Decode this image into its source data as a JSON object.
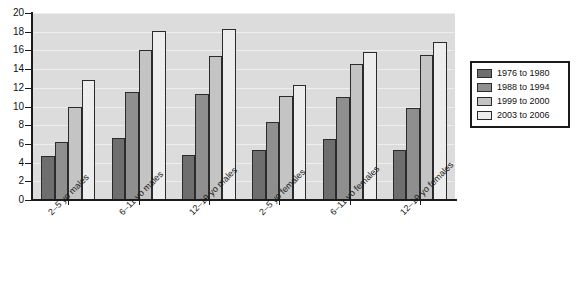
{
  "chart_data": {
    "type": "bar",
    "title": "",
    "xlabel": "",
    "ylabel": "",
    "ylim": [
      0,
      20
    ],
    "ytick_step": 2,
    "grid": true,
    "legend_position": "right",
    "categories": [
      "2–5 yo males",
      "6–11 yo males",
      "12–19 yo males",
      "2–5 yo females",
      "6–11 yo females",
      "12–19 yo females"
    ],
    "ytick_labels": [
      "0",
      "2",
      "4",
      "6",
      "8",
      "10",
      "12",
      "14",
      "16",
      "18",
      "20"
    ],
    "series": [
      {
        "name": "1976 to 1980",
        "color": "#6e6e6e",
        "values": [
          4.7,
          6.6,
          4.8,
          5.4,
          6.5,
          5.4
        ]
      },
      {
        "name": "1988 to 1994",
        "color": "#8f8f8f",
        "values": [
          6.2,
          11.6,
          11.3,
          8.3,
          11.0,
          9.8
        ]
      },
      {
        "name": "1999 to 2000",
        "color": "#c4c4c4",
        "values": [
          9.9,
          16.0,
          15.4,
          11.1,
          14.5,
          15.5
        ]
      },
      {
        "name": "2003 to 2006",
        "color": "#ededed",
        "values": [
          12.8,
          18.1,
          18.3,
          12.3,
          15.8,
          16.9
        ]
      }
    ]
  },
  "legend": {
    "items": [
      {
        "label": "1976 to 1980",
        "color": "#6e6e6e"
      },
      {
        "label": "1988 to 1994",
        "color": "#8f8f8f"
      },
      {
        "label": "1999 to 2000",
        "color": "#c4c4c4"
      },
      {
        "label": "2003 to 2006",
        "color": "#ededed"
      }
    ]
  },
  "colors": {
    "plot_background": "#dcdcdc",
    "gridline": "#eeeeee",
    "axis": "#1a1a1a",
    "bar_border": "#2b2b2b",
    "page_background": "#ffffff"
  }
}
